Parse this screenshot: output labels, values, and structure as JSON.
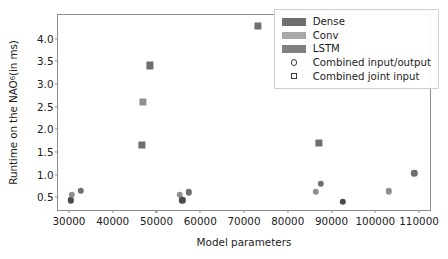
{
  "chart_data": {
    "type": "scatter",
    "title": "",
    "xlabel": "Model parameters",
    "ylabel": "Runtime on the NAO6 (in ms)",
    "ylabel_text": "Runtime on the NAO",
    "ylabel_sup": "6",
    "ylabel_tail": " (in ms)",
    "xlim": [
      27500,
      112500
    ],
    "ylim": [
      0.22,
      4.52
    ],
    "grid": false,
    "xticks": [
      30000,
      40000,
      50000,
      60000,
      70000,
      80000,
      90000,
      100000,
      110000
    ],
    "xticklabels": [
      "30000",
      "40000",
      "50000",
      "60000",
      "70000",
      "80000",
      "90000",
      "100000",
      "110000"
    ],
    "yticks": [
      0.5,
      1.0,
      1.5,
      2.0,
      2.5,
      3.0,
      3.5,
      4.0
    ],
    "yticklabels": [
      "0.5",
      "1.0",
      "1.5",
      "2.0",
      "2.5",
      "3.0",
      "3.5",
      "4.0"
    ],
    "legend": {
      "position": "upper right",
      "entries": [
        {
          "label": "Dense",
          "key": "patch",
          "color": "#6e6e6e"
        },
        {
          "label": "Conv",
          "key": "patch",
          "color": "#a8a8a8"
        },
        {
          "label": "LSTM",
          "key": "patch",
          "color": "#808080"
        },
        {
          "label": "Combined input/output",
          "key": "circle",
          "color": "#3a3a3a"
        },
        {
          "label": "Combined joint input",
          "key": "square",
          "color": "#3a3a3a"
        }
      ]
    },
    "series": [
      {
        "name": "Combined input/output",
        "marker": "circle",
        "points": [
          {
            "x": 30400,
            "y": 0.43,
            "color": "#4a4a4a"
          },
          {
            "x": 30600,
            "y": 0.56,
            "color": "#8f8f8f"
          },
          {
            "x": 32700,
            "y": 0.65,
            "color": "#6f6f6f"
          },
          {
            "x": 55400,
            "y": 0.56,
            "color": "#8f8f8f"
          },
          {
            "x": 55900,
            "y": 0.43,
            "color": "#4a4a4a"
          },
          {
            "x": 57400,
            "y": 0.61,
            "color": "#6f6f6f"
          },
          {
            "x": 86400,
            "y": 0.62,
            "color": "#8f8f8f"
          },
          {
            "x": 87600,
            "y": 0.8,
            "color": "#6f6f6f"
          },
          {
            "x": 92600,
            "y": 0.4,
            "color": "#4a4a4a"
          },
          {
            "x": 103100,
            "y": 0.63,
            "color": "#8f8f8f"
          },
          {
            "x": 108900,
            "y": 1.03,
            "color": "#6f6f6f"
          }
        ]
      },
      {
        "name": "Combined joint input",
        "marker": "square",
        "points": [
          {
            "x": 46700,
            "y": 1.66,
            "color": "#6f6f6f"
          },
          {
            "x": 46900,
            "y": 2.61,
            "color": "#8f8f8f"
          },
          {
            "x": 48500,
            "y": 3.41,
            "color": "#6f6f6f"
          },
          {
            "x": 73200,
            "y": 4.28,
            "color": "#6f6f6f"
          },
          {
            "x": 87200,
            "y": 1.7,
            "color": "#6f6f6f"
          }
        ]
      }
    ]
  }
}
